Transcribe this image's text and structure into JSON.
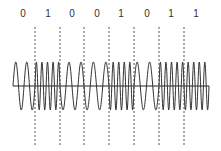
{
  "chart_data": {
    "type": "fsk-waveform",
    "title": "",
    "bits": [
      "0",
      "1",
      "0",
      "0",
      "1",
      "0",
      "1",
      "1"
    ],
    "cycles_per_bit": {
      "0": 2,
      "1": 4.5
    },
    "bit_label_x": [
      23,
      48,
      72,
      97,
      121,
      147,
      171,
      196
    ],
    "boundary_x": [
      35,
      60,
      84,
      109,
      134,
      159,
      184
    ],
    "wave": {
      "x_start": 13,
      "x_end": 209,
      "center_y": 86,
      "amplitude": 24
    },
    "dashed_line": {
      "y_top": 27,
      "y_bottom": 146
    },
    "colors": {
      "wave": "#333333",
      "axis": "#222222",
      "dashed": "#555555",
      "text": "#333333"
    }
  }
}
